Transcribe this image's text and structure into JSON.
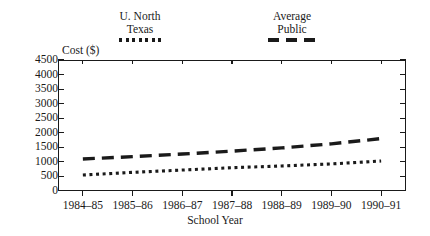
{
  "chart_data": {
    "type": "line",
    "title": "",
    "xlabel": "School Year",
    "ylabel": "Cost ($)",
    "categories": [
      "1984–85",
      "1985–86",
      "1986–87",
      "1987–88",
      "1988–89",
      "1989–90",
      "1990–91"
    ],
    "ylim": [
      0,
      4500
    ],
    "yticks": [
      0,
      500,
      1000,
      1500,
      2000,
      2500,
      3000,
      3500,
      4000,
      4500
    ],
    "ytick_labels": [
      "0",
      "500",
      "1000",
      "1500",
      "2000",
      "2500",
      "3000",
      "3500",
      "4000",
      "4500"
    ],
    "grid": false,
    "legend_position": "above-plot",
    "series": [
      {
        "name": "U. North Texas",
        "style": "dotted",
        "color": "#1a1a1a",
        "values": [
          550,
          640,
          720,
          800,
          860,
          930,
          1030
        ]
      },
      {
        "name": "Average Public",
        "style": "dashed",
        "color": "#1a1a1a",
        "values": [
          1100,
          1180,
          1270,
          1370,
          1480,
          1620,
          1800
        ]
      }
    ]
  },
  "legend": {
    "entries": [
      {
        "line1": "U. North",
        "line2": "Texas",
        "swatch": "dotted-line-swatch"
      },
      {
        "line1": "Average",
        "line2": "Public",
        "swatch": "dashed-line-swatch"
      }
    ]
  },
  "axes": {
    "y_title": "Cost ($)",
    "x_title": "School Year"
  }
}
